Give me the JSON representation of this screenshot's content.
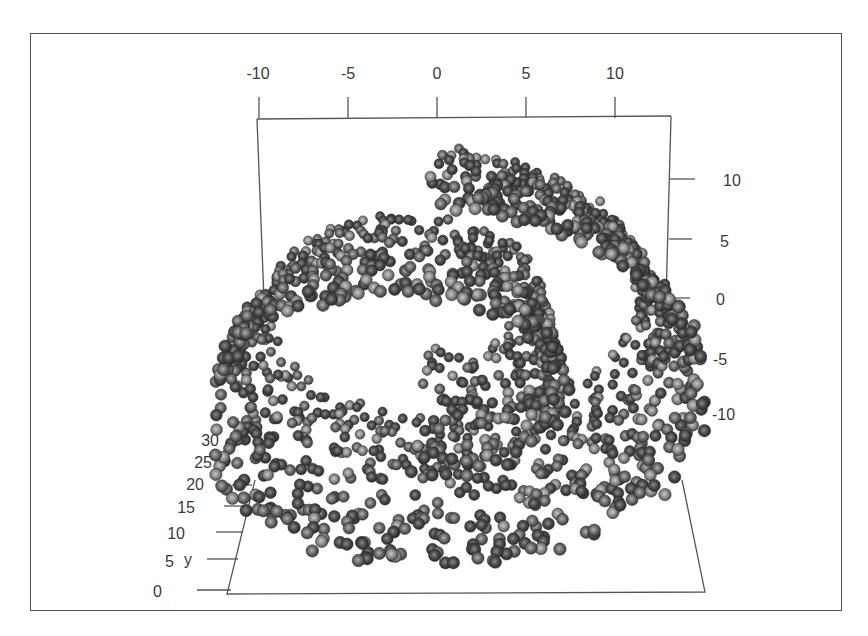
{
  "chart_data": {
    "type": "scatter",
    "subtype": "3d_scatter",
    "title": "",
    "axes": {
      "x": {
        "label": "",
        "position": "top",
        "ticks": [
          -10,
          -5,
          0,
          5,
          10
        ],
        "range": [
          -11,
          13
        ]
      },
      "z": {
        "label": "",
        "position": "right",
        "ticks": [
          10,
          5,
          0,
          -5,
          -10
        ],
        "range": [
          -12,
          14
        ]
      },
      "y": {
        "label": "y",
        "position": "left-depth",
        "ticks": [
          0,
          5,
          10,
          15,
          20,
          25,
          30
        ],
        "range": [
          0,
          30
        ]
      }
    },
    "series": [
      {
        "name": "swiss-roll",
        "marker": "shaded-sphere",
        "color_scale": "grayscale",
        "approx_point_count": 1600,
        "parametric": {
          "t_range": [
            4.7,
            14.1
          ],
          "x": "t*cos(t)",
          "z": "t*sin(t)",
          "y_range": [
            0,
            30
          ]
        }
      }
    ],
    "grid": false,
    "legend": null
  },
  "axes_labels": {
    "x_ticks": [
      "-10",
      "-5",
      "0",
      "5",
      "10"
    ],
    "z_ticks": [
      "10",
      "5",
      "0",
      "-5",
      "-10"
    ],
    "y_ticks": [
      "30",
      "25",
      "20",
      "15",
      "10",
      "5",
      "0"
    ],
    "y_name": "y"
  },
  "colors": {
    "frame": "#555555",
    "box_lines": "#555555",
    "point_dark": "#2e2e2e",
    "point_light": "#b8b8b8",
    "background": "#ffffff"
  }
}
